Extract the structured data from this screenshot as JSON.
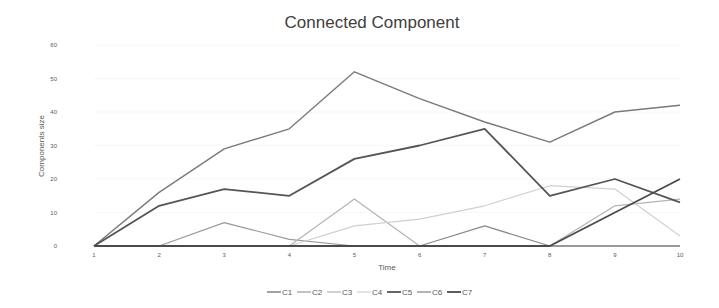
{
  "chart_data": {
    "type": "line",
    "title": "Connected Component",
    "xlabel": "Time",
    "ylabel": "Components size",
    "x": [
      1,
      2,
      3,
      4,
      5,
      6,
      7,
      8,
      9,
      10
    ],
    "categories": [
      "1",
      "2",
      "3",
      "4",
      "5",
      "6",
      "7",
      "8",
      "9",
      "10"
    ],
    "ylim": [
      0,
      60
    ],
    "yticks": [
      0,
      10,
      20,
      30,
      40,
      50,
      60
    ],
    "grid": false,
    "legend_position": "bottom",
    "series": [
      {
        "name": "C1",
        "color": "#7a7a7a",
        "width": 1.4,
        "values": [
          0,
          16,
          29,
          35,
          52,
          44,
          37,
          31,
          40,
          42
        ]
      },
      {
        "name": "C2",
        "color": "#9a9a9a",
        "width": 1.2,
        "values": [
          0,
          0,
          7,
          2,
          0,
          0,
          0,
          0,
          0,
          0
        ]
      },
      {
        "name": "C3",
        "color": "#b4b4b4",
        "width": 1.2,
        "values": [
          0,
          0,
          0,
          0,
          14,
          0,
          0,
          0,
          12,
          14
        ]
      },
      {
        "name": "C4",
        "color": "#d0d0d0",
        "width": 1.2,
        "values": [
          0,
          0,
          0,
          0,
          6,
          8,
          12,
          18,
          17,
          3
        ]
      },
      {
        "name": "C5",
        "color": "#555555",
        "width": 1.8,
        "values": [
          0,
          12,
          17,
          15,
          26,
          30,
          35,
          15,
          20,
          13
        ]
      },
      {
        "name": "C6",
        "color": "#8a8a8a",
        "width": 1.3,
        "values": [
          0,
          0,
          0,
          0,
          0,
          0,
          6,
          0,
          0,
          0
        ]
      },
      {
        "name": "C7",
        "color": "#4a4a4a",
        "width": 1.8,
        "values": [
          0,
          0,
          0,
          0,
          0,
          0,
          0,
          0,
          10,
          20
        ]
      }
    ]
  }
}
